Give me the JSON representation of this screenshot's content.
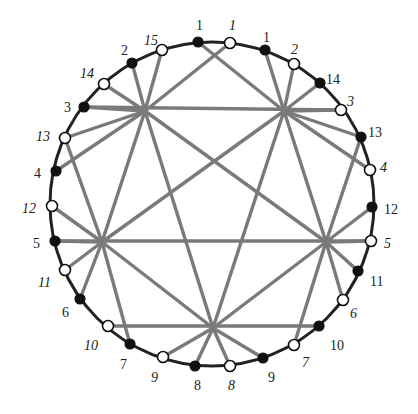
{
  "diagram": {
    "type": "circular chord diagram (pentagram of chords)",
    "circle": {
      "cx": 212,
      "cy": 204,
      "r": 162
    },
    "hubs": {
      "UL": [
        145,
        111
      ],
      "UR": [
        284,
        111
      ],
      "L": [
        102,
        242
      ],
      "R": [
        326,
        242
      ],
      "B": [
        213,
        328
      ]
    },
    "points": [
      {
        "id": "f1",
        "label": "1",
        "filled": true,
        "italic": false,
        "x": 198,
        "y": 42,
        "lx": 196,
        "ly": 30
      },
      {
        "id": "o1",
        "label": "1",
        "filled": false,
        "italic": true,
        "x": 230,
        "y": 43,
        "lx": 229,
        "ly": 30
      },
      {
        "id": "f1r",
        "label": "1",
        "filled": true,
        "italic": false,
        "x": 265,
        "y": 50,
        "lx": 263,
        "ly": 42
      },
      {
        "id": "o2r",
        "label": "2",
        "filled": false,
        "italic": true,
        "x": 294,
        "y": 64,
        "lx": 291,
        "ly": 54
      },
      {
        "id": "f14r",
        "label": "14",
        "filled": true,
        "italic": false,
        "x": 320,
        "y": 83,
        "lx": 326,
        "ly": 84
      },
      {
        "id": "o3r",
        "label": "3",
        "filled": false,
        "italic": true,
        "x": 341,
        "y": 110,
        "lx": 347,
        "ly": 106
      },
      {
        "id": "f13r",
        "label": "13",
        "filled": true,
        "italic": false,
        "x": 361,
        "y": 137,
        "lx": 368,
        "ly": 137
      },
      {
        "id": "o4r",
        "label": "4",
        "filled": false,
        "italic": true,
        "x": 370,
        "y": 170,
        "lx": 380,
        "ly": 172
      },
      {
        "id": "f12r",
        "label": "12",
        "filled": true,
        "italic": false,
        "x": 372,
        "y": 207,
        "lx": 384,
        "ly": 214
      },
      {
        "id": "o5r",
        "label": "5",
        "filled": false,
        "italic": true,
        "x": 371,
        "y": 241,
        "lx": 384,
        "ly": 248
      },
      {
        "id": "f11r",
        "label": "11",
        "filled": true,
        "italic": false,
        "x": 358,
        "y": 271,
        "lx": 370,
        "ly": 286
      },
      {
        "id": "o6r",
        "label": "6",
        "filled": false,
        "italic": true,
        "x": 343,
        "y": 300,
        "lx": 350,
        "ly": 318
      },
      {
        "id": "f10r",
        "label": "10",
        "filled": true,
        "italic": false,
        "x": 319,
        "y": 326,
        "lx": 330,
        "ly": 350
      },
      {
        "id": "o7r",
        "label": "7",
        "filled": false,
        "italic": true,
        "x": 294,
        "y": 345,
        "lx": 302,
        "ly": 367
      },
      {
        "id": "f9r",
        "label": "9",
        "filled": true,
        "italic": false,
        "x": 263,
        "y": 358,
        "lx": 268,
        "ly": 382
      },
      {
        "id": "o8",
        "label": "8",
        "filled": false,
        "italic": true,
        "x": 230,
        "y": 366,
        "lx": 228,
        "ly": 390
      },
      {
        "id": "f8",
        "label": "8",
        "filled": true,
        "italic": false,
        "x": 195,
        "y": 366,
        "lx": 194,
        "ly": 390
      },
      {
        "id": "o9l",
        "label": "9",
        "filled": false,
        "italic": true,
        "x": 163,
        "y": 357,
        "lx": 151,
        "ly": 382
      },
      {
        "id": "f7l",
        "label": "7",
        "filled": true,
        "italic": false,
        "x": 130,
        "y": 344,
        "lx": 120,
        "ly": 369
      },
      {
        "id": "o10l",
        "label": "10",
        "filled": false,
        "italic": true,
        "x": 108,
        "y": 326,
        "lx": 84,
        "ly": 350
      },
      {
        "id": "f6l",
        "label": "6",
        "filled": true,
        "italic": false,
        "x": 80,
        "y": 299,
        "lx": 62,
        "ly": 317
      },
      {
        "id": "o11l",
        "label": "11",
        "filled": false,
        "italic": true,
        "x": 65,
        "y": 270,
        "lx": 38,
        "ly": 287
      },
      {
        "id": "f5l",
        "label": "5",
        "filled": true,
        "italic": false,
        "x": 55,
        "y": 241,
        "lx": 33,
        "ly": 248
      },
      {
        "id": "o12l",
        "label": "12",
        "filled": false,
        "italic": true,
        "x": 52,
        "y": 206,
        "lx": 22,
        "ly": 213
      },
      {
        "id": "f4l",
        "label": "4",
        "filled": true,
        "italic": false,
        "x": 56,
        "y": 171,
        "lx": 34,
        "ly": 178
      },
      {
        "id": "o13l",
        "label": "13",
        "filled": false,
        "italic": true,
        "x": 65,
        "y": 138,
        "lx": 36,
        "ly": 141
      },
      {
        "id": "f3l",
        "label": "3",
        "filled": true,
        "italic": false,
        "x": 84,
        "y": 107,
        "lx": 64,
        "ly": 112
      },
      {
        "id": "o14l",
        "label": "14",
        "filled": false,
        "italic": true,
        "x": 104,
        "y": 84,
        "lx": 80,
        "ly": 78
      },
      {
        "id": "f2l",
        "label": "2",
        "filled": true,
        "italic": false,
        "x": 132,
        "y": 63,
        "lx": 121,
        "ly": 55
      },
      {
        "id": "o15l",
        "label": "15",
        "filled": false,
        "italic": true,
        "x": 162,
        "y": 50,
        "lx": 144,
        "ly": 45
      }
    ],
    "segments": [
      [
        "f3l",
        "o3r"
      ],
      [
        "f5l",
        "o5r"
      ],
      [
        "o10l",
        "f10r"
      ],
      [
        "UL",
        "f2l"
      ],
      [
        "UL",
        "o15l"
      ],
      [
        "UL",
        "o1"
      ],
      [
        "UL",
        "o14l"
      ],
      [
        "UL",
        "f3l"
      ],
      [
        "UL",
        "f4l"
      ],
      [
        "UL",
        "o13l"
      ],
      [
        "UR",
        "f1"
      ],
      [
        "UR",
        "f1r"
      ],
      [
        "UR",
        "o2r"
      ],
      [
        "UR",
        "f14r"
      ],
      [
        "UR",
        "o3r"
      ],
      [
        "UR",
        "o4r"
      ],
      [
        "UR",
        "f13r"
      ],
      [
        "L",
        "o13l"
      ],
      [
        "L",
        "o12l"
      ],
      [
        "L",
        "f5l"
      ],
      [
        "L",
        "o11l"
      ],
      [
        "L",
        "f6l"
      ],
      [
        "L",
        "f7l"
      ],
      [
        "R",
        "f13r"
      ],
      [
        "R",
        "f12r"
      ],
      [
        "R",
        "o5r"
      ],
      [
        "R",
        "f11r"
      ],
      [
        "R",
        "o6r"
      ],
      [
        "R",
        "o7r"
      ],
      [
        "B",
        "o9l"
      ],
      [
        "B",
        "f8"
      ],
      [
        "B",
        "o8"
      ],
      [
        "B",
        "f9r"
      ],
      [
        "UL",
        "B"
      ],
      [
        "UR",
        "B"
      ],
      [
        "UL",
        "R"
      ],
      [
        "UR",
        "L"
      ],
      [
        "L",
        "UR"
      ],
      [
        "R",
        "UL"
      ],
      [
        "L",
        "B"
      ],
      [
        "R",
        "B"
      ],
      [
        "UL",
        "L"
      ],
      [
        "UR",
        "R"
      ]
    ],
    "colors": {
      "chord": "#7a7a7a",
      "circle": "#222222",
      "filled_point": "#111111",
      "open_point": "#ffffff",
      "label": "#222222"
    }
  }
}
